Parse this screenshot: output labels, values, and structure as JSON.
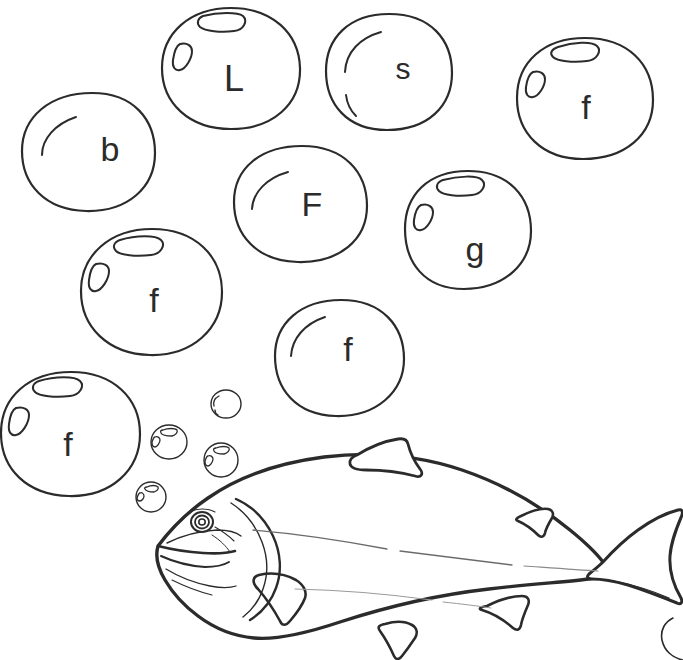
{
  "page": {
    "background_color": "#ffffff",
    "ink_color": "#2b2b2b",
    "width": 683,
    "height": 660
  },
  "artwork": {
    "subject_label": "rainbow trout / salmon line drawing",
    "style": "black and white coloring page line art",
    "stroke_color": "#2b2b2b",
    "letter_color": "#2b2b2b"
  },
  "bubbles": [
    {
      "id": "bubble-L",
      "letter": "L",
      "size": "large",
      "highlight_style": "rounded-bars",
      "cx": 231,
      "cy": 68,
      "rx": 69,
      "ry": 60,
      "rotate": -8,
      "letter_x": 234,
      "letter_y": 81,
      "letter_size": 36
    },
    {
      "id": "bubble-s",
      "letter": "s",
      "size": "large",
      "highlight_style": "arcs",
      "cx": 389,
      "cy": 72,
      "rx": 63,
      "ry": 58,
      "rotate": 6,
      "letter_x": 403,
      "letter_y": 71,
      "letter_size": 30
    },
    {
      "id": "bubble-f-topright",
      "letter": "f",
      "size": "large",
      "highlight_style": "rounded-bars",
      "cx": 585,
      "cy": 98,
      "rx": 68,
      "ry": 60,
      "rotate": -4,
      "letter_x": 586,
      "letter_y": 110,
      "letter_size": 34
    },
    {
      "id": "bubble-b",
      "letter": "b",
      "size": "large",
      "highlight_style": "arcs",
      "cx": 88,
      "cy": 152,
      "rx": 67,
      "ry": 58,
      "rotate": 10,
      "letter_x": 110,
      "letter_y": 152,
      "letter_size": 34
    },
    {
      "id": "bubble-F",
      "letter": "F",
      "size": "large",
      "highlight_style": "arcs",
      "cx": 300,
      "cy": 204,
      "rx": 67,
      "ry": 58,
      "rotate": -6,
      "letter_x": 312,
      "letter_y": 207,
      "letter_size": 34
    },
    {
      "id": "bubble-g",
      "letter": "g",
      "size": "large",
      "highlight_style": "rounded-bars",
      "cx": 468,
      "cy": 230,
      "rx": 63,
      "ry": 59,
      "rotate": -3,
      "letter_x": 475,
      "letter_y": 252,
      "letter_size": 34
    },
    {
      "id": "bubble-f-middleleft",
      "letter": "f",
      "size": "large",
      "highlight_style": "rounded-bars",
      "cx": 151,
      "cy": 292,
      "rx": 71,
      "ry": 63,
      "rotate": -5,
      "letter_x": 154,
      "letter_y": 303,
      "letter_size": 34
    },
    {
      "id": "bubble-f-center",
      "letter": "f",
      "size": "large",
      "highlight_style": "arcs",
      "cx": 339,
      "cy": 358,
      "rx": 64,
      "ry": 58,
      "rotate": 8,
      "letter_x": 348,
      "letter_y": 352,
      "letter_size": 34
    },
    {
      "id": "bubble-f-bottomleft",
      "letter": "f",
      "size": "large",
      "highlight_style": "rounded-bars",
      "cx": 70,
      "cy": 434,
      "rx": 70,
      "ry": 62,
      "rotate": -6,
      "letter_x": 68,
      "letter_y": 447,
      "letter_size": 34
    },
    {
      "id": "bubble-small-1",
      "letter": "",
      "size": "small",
      "highlight_style": "mini-arc",
      "cx": 226,
      "cy": 404,
      "rx": 15,
      "ry": 14,
      "rotate": 0,
      "letter_x": 0,
      "letter_y": 0,
      "letter_size": 0
    },
    {
      "id": "bubble-small-2",
      "letter": "",
      "size": "small",
      "highlight_style": "mini-bars",
      "cx": 169,
      "cy": 442,
      "rx": 18,
      "ry": 17,
      "rotate": 0,
      "letter_x": 0,
      "letter_y": 0,
      "letter_size": 0
    },
    {
      "id": "bubble-small-3",
      "letter": "",
      "size": "small",
      "highlight_style": "mini-bars",
      "cx": 221,
      "cy": 460,
      "rx": 17,
      "ry": 17,
      "rotate": 0,
      "letter_x": 0,
      "letter_y": 0,
      "letter_size": 0
    },
    {
      "id": "bubble-small-4",
      "letter": "",
      "size": "small",
      "highlight_style": "mini-bars",
      "cx": 151,
      "cy": 497,
      "rx": 15,
      "ry": 15,
      "rotate": 0,
      "letter_x": 0,
      "letter_y": 0,
      "letter_size": 0
    }
  ],
  "letters_in_order": [
    "L",
    "s",
    "f",
    "b",
    "F",
    "g",
    "f",
    "f",
    "f"
  ],
  "fish": {
    "name": "fish-illustration",
    "parts": [
      "body-outline",
      "head",
      "mouth",
      "eye",
      "gill-plate",
      "dorsal-fin",
      "adipose-fin",
      "pectoral-fin",
      "pelvic-fin",
      "anal-fin",
      "caudal-fin",
      "lateral-line"
    ]
  },
  "corner_mark": {
    "name": "partial-bubble-arc",
    "description": "small arc of a cut-off bubble at bottom right corner"
  }
}
